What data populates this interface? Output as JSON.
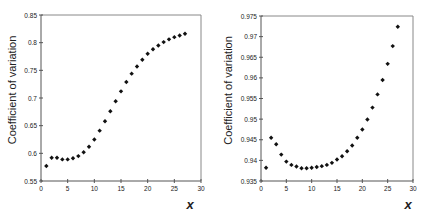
{
  "chart_data": [
    {
      "type": "scatter",
      "title": "",
      "xlabel": "x",
      "ylabel": "Coefficient of variation",
      "xlim": [
        0,
        30
      ],
      "ylim": [
        0.55,
        0.85
      ],
      "xticks": [
        "0",
        "5",
        "10",
        "15",
        "20",
        "25",
        "30"
      ],
      "yticks": [
        "0.55",
        "0.6",
        "0.65",
        "0.7",
        "0.75",
        "0.8",
        "0.85"
      ],
      "grid": false,
      "marker": "diamond",
      "x": [
        1,
        2,
        3,
        4,
        5,
        6,
        7,
        8,
        9,
        10,
        11,
        12,
        13,
        14,
        15,
        16,
        17,
        18,
        19,
        20,
        21,
        22,
        23,
        24,
        25,
        26,
        27
      ],
      "values": [
        0.577,
        0.592,
        0.592,
        0.589,
        0.589,
        0.591,
        0.595,
        0.602,
        0.612,
        0.625,
        0.641,
        0.658,
        0.676,
        0.694,
        0.712,
        0.729,
        0.744,
        0.757,
        0.769,
        0.78,
        0.788,
        0.795,
        0.801,
        0.806,
        0.81,
        0.813,
        0.816
      ]
    },
    {
      "type": "scatter",
      "title": "",
      "xlabel": "x",
      "ylabel": "Coefficient of variation",
      "xlim": [
        0,
        30
      ],
      "ylim": [
        0.935,
        0.975
      ],
      "xticks": [
        "0",
        "5",
        "10",
        "15",
        "20",
        "25",
        "30"
      ],
      "yticks": [
        "0.935",
        "0.94",
        "0.945",
        "0.95",
        "0.955",
        "0.96",
        "0.965",
        "0.97",
        "0.975"
      ],
      "grid": false,
      "marker": "diamond",
      "x": [
        1,
        2,
        3,
        4,
        5,
        6,
        7,
        8,
        9,
        10,
        11,
        12,
        13,
        14,
        15,
        16,
        17,
        18,
        19,
        20,
        21,
        22,
        23,
        24,
        25,
        26,
        27
      ],
      "values": [
        0.9382,
        0.9455,
        0.9439,
        0.9414,
        0.9397,
        0.9389,
        0.9385,
        0.9381,
        0.9381,
        0.9382,
        0.9384,
        0.9386,
        0.9389,
        0.9394,
        0.9402,
        0.941,
        0.9422,
        0.9436,
        0.9455,
        0.9475,
        0.9499,
        0.9528,
        0.956,
        0.9595,
        0.9634,
        0.9677,
        0.9724
      ]
    }
  ],
  "style": {
    "marker_color": "#111111",
    "axis_color": "#555555",
    "frame_color": "#888888",
    "text_color": "#222222"
  }
}
